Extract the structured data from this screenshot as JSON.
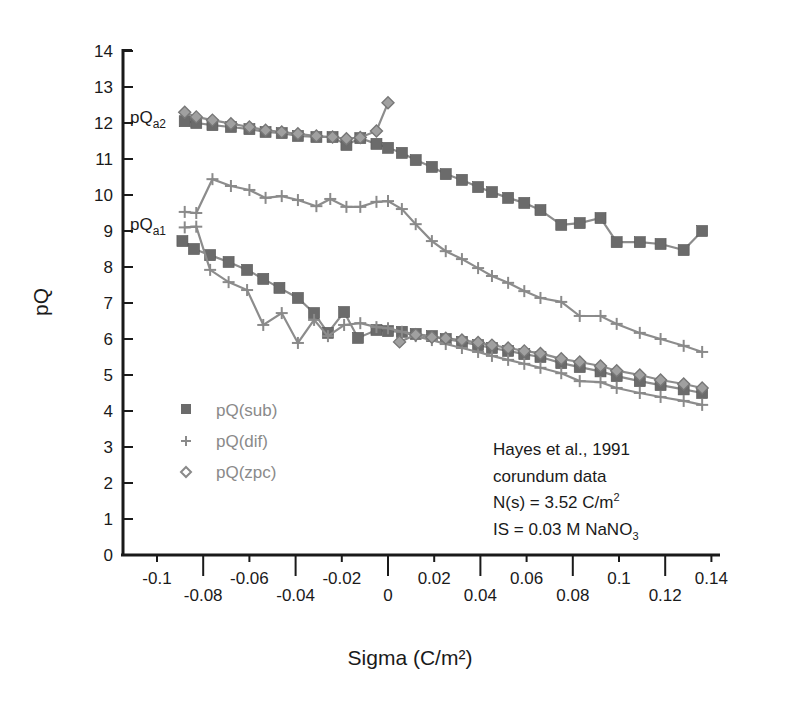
{
  "chart_data": {
    "type": "line",
    "title": "",
    "xlabel": "Sigma (C/m²)",
    "ylabel": "pQ",
    "xlim": [
      -0.1,
      0.14
    ],
    "ylim": [
      0,
      14
    ],
    "grid": false,
    "legend_position": "lower-left inside",
    "x_ticks_upper": [
      "-0.1",
      "-0.06",
      "-0.02",
      "0.02",
      "0.06",
      "0.1",
      "0.14"
    ],
    "x_ticks_lower": [
      "-0.08",
      "-0.04",
      "0",
      "0.04",
      "0.08",
      "0.12"
    ],
    "y_ticks": [
      "0",
      "1",
      "2",
      "3",
      "4",
      "5",
      "6",
      "7",
      "8",
      "9",
      "10",
      "11",
      "12",
      "13",
      "14"
    ],
    "curve_labels": [
      {
        "text": "pQ",
        "sub": "a2",
        "x": -0.1,
        "y": 12.1
      },
      {
        "text": "pQ",
        "sub": "a1",
        "x": -0.1,
        "y": 8.9
      }
    ],
    "annotation": {
      "line1": "Hayes et al., 1991",
      "line2": "corundum data",
      "line3_prefix": "N(s) = 3.52 C/m",
      "line3_sup": "2",
      "line4_prefix": "IS = 0.03 M NaNO",
      "line4_sub": "3"
    },
    "series": [
      {
        "name": "pQ(sub)",
        "marker": "square",
        "branch": "a2",
        "color": "#6b6b6b",
        "points": [
          [
            -0.088,
            12.05
          ],
          [
            -0.083,
            12.0
          ],
          [
            -0.076,
            11.94
          ],
          [
            -0.068,
            11.89
          ],
          [
            -0.06,
            11.83
          ],
          [
            -0.053,
            11.75
          ],
          [
            -0.046,
            11.72
          ],
          [
            -0.039,
            11.64
          ],
          [
            -0.031,
            11.61
          ],
          [
            -0.024,
            11.61
          ],
          [
            -0.018,
            11.39
          ],
          [
            -0.012,
            11.58
          ],
          [
            -0.005,
            11.42
          ],
          [
            0.0,
            11.31
          ],
          [
            0.006,
            11.17
          ],
          [
            0.012,
            10.97
          ],
          [
            0.019,
            10.78
          ],
          [
            0.025,
            10.58
          ],
          [
            0.032,
            10.42
          ],
          [
            0.039,
            10.22
          ],
          [
            0.045,
            10.08
          ],
          [
            0.052,
            9.92
          ],
          [
            0.059,
            9.78
          ],
          [
            0.066,
            9.58
          ],
          [
            0.075,
            9.17
          ],
          [
            0.083,
            9.22
          ],
          [
            0.092,
            9.36
          ],
          [
            0.099,
            8.69
          ],
          [
            0.109,
            8.69
          ],
          [
            0.118,
            8.64
          ],
          [
            0.128,
            8.47
          ],
          [
            0.136,
            9.0
          ]
        ]
      },
      {
        "name": "pQ(zpc)",
        "marker": "diamond",
        "branch": "a2",
        "color": "#8a8a8a",
        "points": [
          [
            -0.088,
            12.3
          ],
          [
            -0.083,
            12.17
          ],
          [
            -0.076,
            12.08
          ],
          [
            -0.068,
            11.98
          ],
          [
            -0.06,
            11.89
          ],
          [
            -0.053,
            11.8
          ],
          [
            -0.046,
            11.75
          ],
          [
            -0.039,
            11.7
          ],
          [
            -0.031,
            11.64
          ],
          [
            -0.024,
            11.61
          ],
          [
            -0.018,
            11.56
          ],
          [
            -0.012,
            11.6
          ],
          [
            -0.005,
            11.78
          ],
          [
            0.0,
            12.56
          ]
        ]
      },
      {
        "name": "pQ(dif)",
        "marker": "plus",
        "branch": "a2",
        "color": "#8a8a8a",
        "points": [
          [
            -0.088,
            9.53
          ],
          [
            -0.083,
            9.5
          ],
          [
            -0.076,
            10.44
          ],
          [
            -0.068,
            10.25
          ],
          [
            -0.06,
            10.14
          ],
          [
            -0.053,
            9.92
          ],
          [
            -0.046,
            9.97
          ],
          [
            -0.039,
            9.86
          ],
          [
            -0.031,
            9.69
          ],
          [
            -0.025,
            9.89
          ],
          [
            -0.018,
            9.67
          ],
          [
            -0.012,
            9.67
          ],
          [
            -0.005,
            9.81
          ],
          [
            0.0,
            9.83
          ],
          [
            0.006,
            9.61
          ],
          [
            0.012,
            9.19
          ],
          [
            0.019,
            8.72
          ],
          [
            0.025,
            8.44
          ],
          [
            0.032,
            8.22
          ],
          [
            0.039,
            7.97
          ],
          [
            0.045,
            7.75
          ],
          [
            0.052,
            7.56
          ],
          [
            0.059,
            7.33
          ],
          [
            0.066,
            7.14
          ],
          [
            0.075,
            7.03
          ],
          [
            0.083,
            6.64
          ],
          [
            0.092,
            6.64
          ],
          [
            0.099,
            6.42
          ],
          [
            0.109,
            6.17
          ],
          [
            0.118,
            6.0
          ],
          [
            0.128,
            5.81
          ],
          [
            0.136,
            5.64
          ]
        ]
      },
      {
        "name": "pQ(sub)",
        "marker": "square",
        "branch": "a1",
        "color": "#6b6b6b",
        "points": [
          [
            -0.089,
            8.72
          ],
          [
            -0.084,
            8.5
          ],
          [
            -0.077,
            8.33
          ],
          [
            -0.069,
            8.14
          ],
          [
            -0.061,
            7.92
          ],
          [
            -0.054,
            7.67
          ],
          [
            -0.047,
            7.42
          ],
          [
            -0.039,
            7.14
          ],
          [
            -0.032,
            6.72
          ],
          [
            -0.026,
            6.17
          ],
          [
            -0.019,
            6.75
          ],
          [
            -0.013,
            6.03
          ],
          [
            -0.005,
            6.25
          ],
          [
            0.0,
            6.22
          ],
          [
            0.006,
            6.2
          ],
          [
            0.012,
            6.14
          ],
          [
            0.019,
            6.08
          ],
          [
            0.025,
            6.0
          ],
          [
            0.032,
            5.92
          ],
          [
            0.039,
            5.83
          ],
          [
            0.045,
            5.75
          ],
          [
            0.052,
            5.67
          ],
          [
            0.059,
            5.58
          ],
          [
            0.066,
            5.5
          ],
          [
            0.075,
            5.33
          ],
          [
            0.083,
            5.22
          ],
          [
            0.092,
            5.1
          ],
          [
            0.099,
            4.97
          ],
          [
            0.109,
            4.83
          ],
          [
            0.118,
            4.72
          ],
          [
            0.128,
            4.6
          ],
          [
            0.136,
            4.5
          ]
        ]
      },
      {
        "name": "pQ(dif)",
        "marker": "plus",
        "branch": "a1",
        "color": "#8a8a8a",
        "points": [
          [
            -0.088,
            9.1
          ],
          [
            -0.083,
            9.12
          ],
          [
            -0.077,
            7.92
          ],
          [
            -0.069,
            7.58
          ],
          [
            -0.061,
            7.36
          ],
          [
            -0.054,
            6.39
          ],
          [
            -0.046,
            6.72
          ],
          [
            -0.039,
            5.89
          ],
          [
            -0.032,
            6.53
          ],
          [
            -0.026,
            6.08
          ],
          [
            -0.019,
            6.39
          ],
          [
            -0.012,
            6.44
          ],
          [
            -0.005,
            6.33
          ],
          [
            0.0,
            6.3
          ],
          [
            0.006,
            6.2
          ],
          [
            0.012,
            6.08
          ],
          [
            0.019,
            5.97
          ],
          [
            0.025,
            5.86
          ],
          [
            0.032,
            5.75
          ],
          [
            0.039,
            5.64
          ],
          [
            0.045,
            5.53
          ],
          [
            0.052,
            5.42
          ],
          [
            0.059,
            5.31
          ],
          [
            0.066,
            5.2
          ],
          [
            0.075,
            5.05
          ],
          [
            0.083,
            4.83
          ],
          [
            0.092,
            4.8
          ],
          [
            0.099,
            4.64
          ],
          [
            0.109,
            4.5
          ],
          [
            0.118,
            4.39
          ],
          [
            0.128,
            4.28
          ],
          [
            0.136,
            4.17
          ]
        ]
      },
      {
        "name": "pQ(zpc)",
        "marker": "diamond",
        "branch": "a1",
        "color": "#8a8a8a",
        "points": [
          [
            0.005,
            5.92
          ],
          [
            0.012,
            6.12
          ],
          [
            0.019,
            6.05
          ],
          [
            0.025,
            6.02
          ],
          [
            0.032,
            5.97
          ],
          [
            0.039,
            5.9
          ],
          [
            0.045,
            5.83
          ],
          [
            0.052,
            5.75
          ],
          [
            0.059,
            5.67
          ],
          [
            0.066,
            5.6
          ],
          [
            0.075,
            5.45
          ],
          [
            0.083,
            5.36
          ],
          [
            0.092,
            5.25
          ],
          [
            0.099,
            5.12
          ],
          [
            0.109,
            5.0
          ],
          [
            0.118,
            4.86
          ],
          [
            0.128,
            4.75
          ],
          [
            0.136,
            4.64
          ]
        ]
      }
    ],
    "legend": [
      {
        "label": "pQ(sub)",
        "marker": "square"
      },
      {
        "label": "pQ(dif)",
        "marker": "plus"
      },
      {
        "label": "pQ(zpc)",
        "marker": "diamond"
      }
    ]
  }
}
